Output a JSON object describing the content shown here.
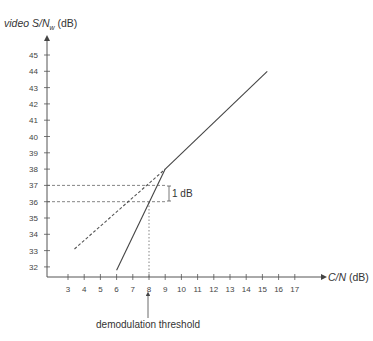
{
  "chart_data": {
    "type": "line",
    "title": "",
    "xlabel": "C/N (dB)",
    "ylabel": "video S/Nw (dB)",
    "ylabel_parts": {
      "italic": "video S/N",
      "sub": "w",
      "unit": " (dB)"
    },
    "xlabel_parts": {
      "italic": "C/N",
      "unit": " (dB)"
    },
    "x_ticks": [
      3,
      4,
      5,
      6,
      7,
      8,
      9,
      10,
      11,
      12,
      13,
      14,
      15,
      16,
      17
    ],
    "y_ticks": [
      32,
      33,
      34,
      35,
      36,
      37,
      38,
      39,
      40,
      41,
      42,
      43,
      44,
      45
    ],
    "xlim": [
      1.7,
      18.8
    ],
    "ylim": [
      31.4,
      46.8
    ],
    "grid": false,
    "series": [
      {
        "name": "FM S/N (above threshold)",
        "style": "solid",
        "points": [
          [
            9.0,
            38.0
          ],
          [
            15.3,
            44.0
          ]
        ]
      },
      {
        "name": "FM S/N (below threshold)",
        "style": "solid",
        "points": [
          [
            6.0,
            31.8
          ],
          [
            9.0,
            38.0
          ]
        ]
      },
      {
        "name": "Linear extrapolation",
        "style": "dashed",
        "points": [
          [
            3.4,
            33.1
          ],
          [
            9.0,
            38.0
          ]
        ]
      }
    ],
    "reference_lines": [
      {
        "type": "horizontal",
        "y": 37,
        "x_from": 1.7,
        "x_to": 9.0,
        "style": "dashed"
      },
      {
        "type": "horizontal",
        "y": 36,
        "x_from": 1.7,
        "x_to": 9.0,
        "style": "dashed"
      },
      {
        "type": "vertical",
        "x": 8,
        "y_from": 31.4,
        "y_to": 36,
        "style": "dotted"
      }
    ],
    "annotations": [
      {
        "text": "1 dB",
        "x": 9.0,
        "y_range": [
          36,
          37
        ]
      },
      {
        "text": "demodulation threshold",
        "x": 8,
        "position": "below x-axis with arrow"
      }
    ]
  },
  "labels": {
    "ylabel_italic": "video S/N",
    "ylabel_sub": "w",
    "ylabel_unit": " (dB)",
    "xlabel_italic": "C/N",
    "xlabel_unit": " (dB)",
    "one_db": "1 dB",
    "threshold": "demodulation threshold"
  }
}
